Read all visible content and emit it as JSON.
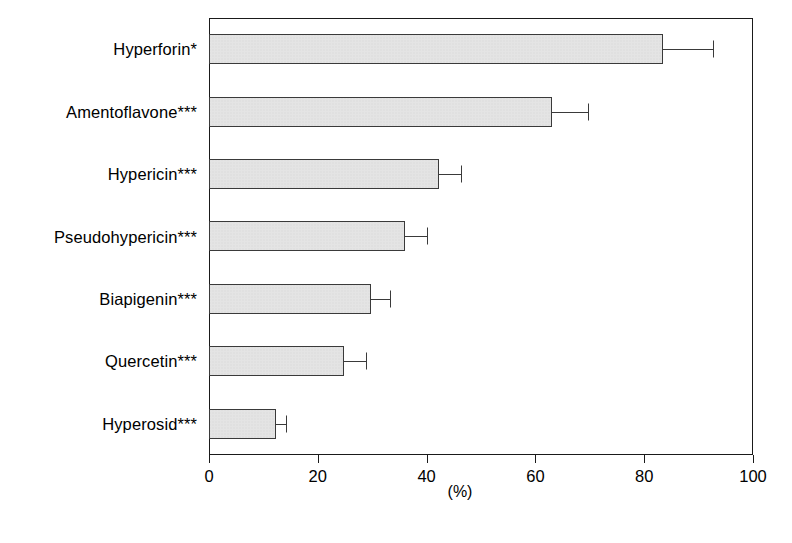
{
  "chart_data": {
    "type": "bar",
    "orientation": "horizontal",
    "title": "",
    "xlabel": "(%)",
    "ylabel": "",
    "xlim": [
      0,
      100
    ],
    "ylim": null,
    "grid": false,
    "legend": null,
    "xticks": [
      0,
      20,
      40,
      60,
      80,
      100
    ],
    "xtick_labels": [
      "0",
      "20",
      "40",
      "60",
      "80",
      "100"
    ],
    "categories": [
      "Hyperforin*",
      "Amentoflavone***",
      "Hypericin***",
      "Pseudohypericin***",
      "Biapigenin***",
      "Quercetin***",
      "Hyperosid***"
    ],
    "values": [
      83.5,
      63.0,
      42.3,
      36.0,
      29.8,
      24.8,
      12.3
    ],
    "errors": [
      9.1,
      6.7,
      4.0,
      4.0,
      3.4,
      4.1,
      1.9
    ],
    "error_upper": [
      92.6,
      69.7,
      46.3,
      40.0,
      33.2,
      28.9,
      14.2
    ],
    "bar_fill": "#e4e4e4",
    "bar_edge": "#3a3a3a",
    "axis_color": "#1a1a1a",
    "background": "#ffffff"
  }
}
